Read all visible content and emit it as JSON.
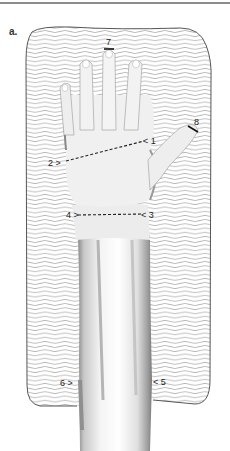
{
  "figure": {
    "panel_label": "a.",
    "colors": {
      "background": "#ffffff",
      "rule": "#8c8c8c",
      "wave_lines": "#9a9a9a",
      "frame_outline": "#444444",
      "skin_shade": "#bdbdbd",
      "ink": "#222222"
    }
  },
  "markers": {
    "m1": "< 1",
    "m2": "2 >",
    "m3": "< 3",
    "m4": "4 >",
    "m5": "< 5",
    "m6": "6 >",
    "m7": "7",
    "m8": "8"
  }
}
